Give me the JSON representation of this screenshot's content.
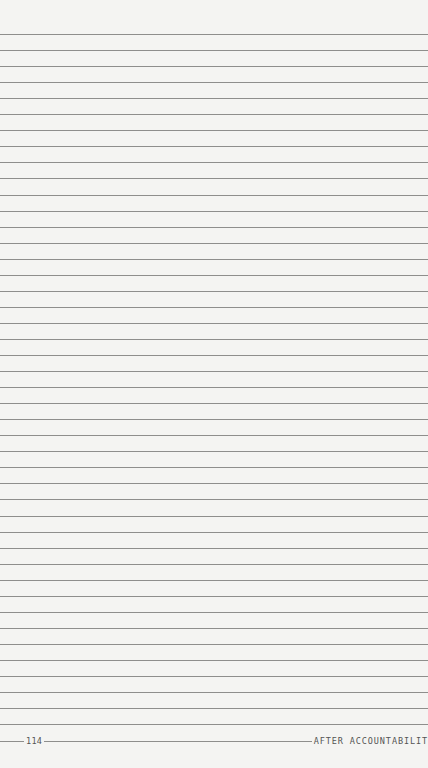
{
  "page": {
    "type": "lined-notes-page",
    "ruled_line_count": 44,
    "first_line_y": 34,
    "line_spacing": 16.05,
    "colors": {
      "paper": "#f4f4f2",
      "rule": "#8e8e8c",
      "text": "#555555"
    }
  },
  "footer": {
    "page_number": "114",
    "running_title": "AFTER ACCOUNTABILIT"
  }
}
